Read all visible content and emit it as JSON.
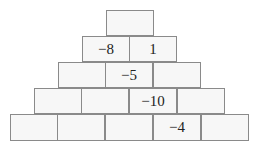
{
  "pyramid": {
    "rows": [
      {
        "cells": [
          ""
        ]
      },
      {
        "cells": [
          "−8",
          "1"
        ]
      },
      {
        "cells": [
          "",
          "−5",
          ""
        ]
      },
      {
        "cells": [
          "",
          "",
          "−10",
          ""
        ]
      },
      {
        "cells": [
          "",
          "",
          "",
          "−4",
          ""
        ]
      }
    ]
  },
  "colors": {
    "cell_fill": "#f7f7f7",
    "cell_border": "#8a8a8a",
    "text": "#222222"
  }
}
